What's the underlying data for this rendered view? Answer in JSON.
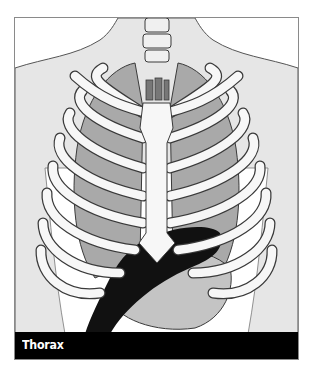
{
  "figure": {
    "caption": "Thorax",
    "colors": {
      "background": "#ffffff",
      "skin": "#e6e6e6",
      "lung": "#a9a9a9",
      "bone": "#f7f7f7",
      "outline": "#3a3a3a",
      "heart": "#111111",
      "abdomen": "#c4c4c4",
      "caption_bar": "#000000",
      "caption_text": "#ffffff"
    }
  }
}
